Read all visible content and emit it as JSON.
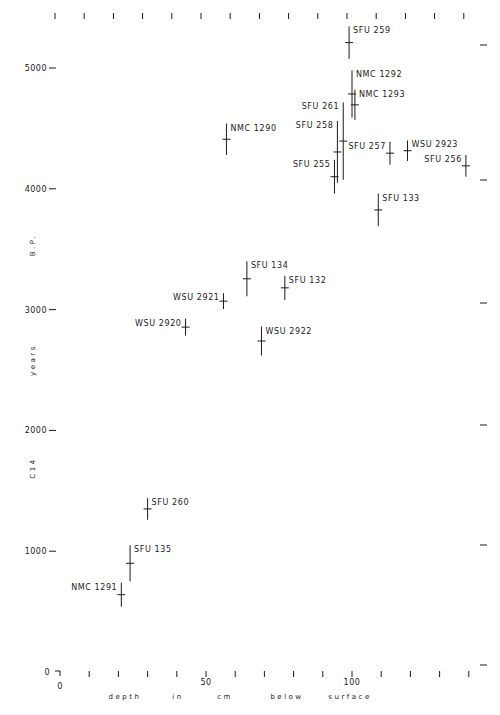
{
  "chart_data": {
    "type": "scatter",
    "title": "",
    "xlabel": "depth in cm below surface",
    "xlabel_words": [
      "depth",
      "in",
      "cm",
      "below",
      "surface"
    ],
    "ylabel": "C14 years B.P.",
    "ylabel_words": [
      "C14",
      "years",
      "B.P."
    ],
    "xlim": [
      0,
      140
    ],
    "ylim": [
      0,
      5400
    ],
    "x_ticks": [
      0,
      10,
      20,
      30,
      40,
      50,
      60,
      70,
      80,
      90,
      100,
      110,
      120,
      130,
      140
    ],
    "x_tick_labels": [
      {
        "value": 0,
        "label": "0"
      },
      {
        "value": 50,
        "label": "50"
      },
      {
        "value": 100,
        "label": "100"
      }
    ],
    "y_ticks": [
      0,
      1000,
      2000,
      3000,
      4000,
      5000
    ],
    "y_tick_labels": [
      "0",
      "1000",
      "2000",
      "3000",
      "4000",
      "5000"
    ],
    "grid": false,
    "legend": null,
    "error_bars": "vertical (± 1 sigma)",
    "series": [
      {
        "name": "Radiocarbon dates",
        "points": [
          {
            "label": "SFU 259",
            "depth": 99,
            "age": 5210,
            "err": 135,
            "label_side": "right"
          },
          {
            "label": "NMC 1292",
            "depth": 100,
            "age": 4785,
            "err": 195,
            "label_side": "right"
          },
          {
            "label": "NMC 1293",
            "depth": 101,
            "age": 4695,
            "err": 125,
            "label_side": "right"
          },
          {
            "label": "SFU 261",
            "depth": 97,
            "age": 4395,
            "err": 320,
            "label_side": "left"
          },
          {
            "label": "SFU 258",
            "depth": 95,
            "age": 4305,
            "err": 255,
            "label_side": "left"
          },
          {
            "label": "SFU 255",
            "depth": 94,
            "age": 4100,
            "err": 140,
            "label_side": "left"
          },
          {
            "label": "SFU 257",
            "depth": 113,
            "age": 4295,
            "err": 95,
            "label_side": "left"
          },
          {
            "label": "WSU 2923",
            "depth": 119,
            "age": 4315,
            "err": 85,
            "label_side": "right"
          },
          {
            "label": "SFU 256",
            "depth": 139,
            "age": 4190,
            "err": 90,
            "label_side": "left"
          },
          {
            "label": "SFU 133",
            "depth": 109,
            "age": 3825,
            "err": 135,
            "label_side": "right"
          },
          {
            "label": "NMC 1290",
            "depth": 57,
            "age": 4410,
            "err": 130,
            "label_side": "right"
          },
          {
            "label": "SFU 134",
            "depth": 64,
            "age": 3255,
            "err": 145,
            "label_side": "right"
          },
          {
            "label": "SFU 132",
            "depth": 77,
            "age": 3180,
            "err": 100,
            "label_side": "right"
          },
          {
            "label": "WSU 2921",
            "depth": 56,
            "age": 3070,
            "err": 65,
            "label_side": "left"
          },
          {
            "label": "WSU 2920",
            "depth": 43,
            "age": 2855,
            "err": 70,
            "label_side": "left"
          },
          {
            "label": "WSU 2922",
            "depth": 69,
            "age": 2740,
            "err": 120,
            "label_side": "right"
          },
          {
            "label": "SFU 260",
            "depth": 30,
            "age": 1350,
            "err": 90,
            "label_side": "right"
          },
          {
            "label": "SFU 135",
            "depth": 24,
            "age": 900,
            "err": 150,
            "label_side": "right"
          },
          {
            "label": "NMC 1291",
            "depth": 21,
            "age": 640,
            "err": 100,
            "label_side": "left"
          }
        ]
      }
    ]
  },
  "axes": {
    "origin_label": "0",
    "x_label_zero": "0",
    "x_label_50": "50",
    "x_label_100": "100"
  }
}
